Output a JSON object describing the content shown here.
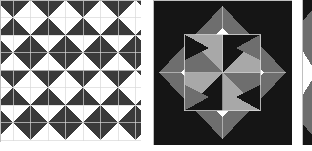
{
  "canvas": {
    "width": 312,
    "height": 151,
    "background_color": "#ffffff",
    "description": "Three quilt block pattern panels arranged horizontally"
  },
  "palette": {
    "dark": "#3a3a3a",
    "black": "#151515",
    "gray": "#6e6e6e",
    "light_gray": "#a8a8a8",
    "white": "#ffffff",
    "seam": "#d8d8d8",
    "edge": "#bfbfbf"
  },
  "panels": [
    {
      "id": "panel-1",
      "name": "checkerboard-diamond-quilt",
      "title": "Checkerboard Diamond Quilt",
      "x": 0,
      "y": 0,
      "width": 141,
      "height": 142,
      "cropped_edges": "left",
      "grid": {
        "cell_size": 35,
        "columns": 4,
        "rows": 4,
        "offset_x": -22,
        "offset_y": 0
      },
      "cell_types": [
        "white-diamond-on-dark",
        "dark-diamond-on-white"
      ],
      "row_pattern": [
        [
          "white-diamond-on-dark",
          "white-diamond-on-dark",
          "white-diamond-on-dark",
          "white-diamond-on-dark",
          "white-diamond-on-dark"
        ],
        [
          "dark-diamond-on-white",
          "dark-diamond-on-white",
          "dark-diamond-on-white",
          "dark-diamond-on-white",
          "dark-diamond-on-white"
        ],
        [
          "white-diamond-on-dark",
          "white-diamond-on-dark",
          "white-diamond-on-dark",
          "white-diamond-on-dark",
          "white-diamond-on-dark"
        ],
        [
          "dark-diamond-on-white",
          "dark-diamond-on-white",
          "dark-diamond-on-white",
          "dark-diamond-on-white",
          "dark-diamond-on-white"
        ]
      ]
    },
    {
      "id": "panel-2",
      "name": "pinwheel-diamond-quilt-block",
      "title": "Pinwheel Diamond Quilt Block",
      "x": 153,
      "y": 0,
      "width": 139,
      "height": 145,
      "cropped_edges": "none",
      "structure": {
        "corner_triangles": "black",
        "diagonal_bands": "gray",
        "inner_diamond": "white",
        "center_block": "pinwheel"
      },
      "center_pinwheel": {
        "size": 76,
        "quadrants": 4,
        "colors": [
          "black",
          "gray",
          "light_gray",
          "white"
        ]
      }
    },
    {
      "id": "panel-3",
      "name": "cropped-quilt-block-sliver",
      "title": "Cropped Quilt Block",
      "x": 300,
      "y": 0,
      "width": 12,
      "height": 145,
      "cropped_edges": "right"
    }
  ],
  "chart_data": {
    "type": "table",
    "categories": [
      "Checkerboard Diamond Quilt",
      "Pinwheel Diamond Quilt Block",
      "Cropped Quilt Block"
    ],
    "values": [
      141,
      139,
      12
    ],
    "xlabel": "Panel",
    "ylabel": "Rendered width (px)"
  }
}
